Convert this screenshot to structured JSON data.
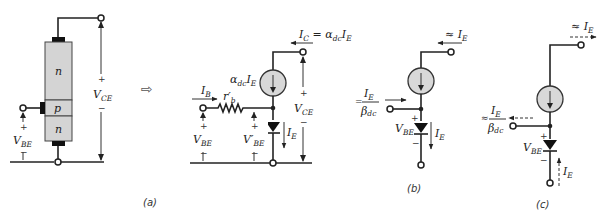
{
  "figure": {
    "panels": [
      {
        "id": "a",
        "caption": "(a)"
      },
      {
        "id": "b",
        "caption": "(b)"
      },
      {
        "id": "c",
        "caption": "(c)"
      }
    ],
    "transistor": {
      "regions": [
        "n",
        "p",
        "n"
      ],
      "vce_label": "V",
      "vce_sub": "CE",
      "vbe_label": "V",
      "vbe_sub": "BE",
      "plus": "+",
      "minus": "−"
    },
    "arrow_symbol": "⇨",
    "model_a": {
      "ic_label": "I",
      "ic_sub": "C",
      "ic_eq": " = α",
      "ic_eq_sub": "dc",
      "ic_rhs": "I",
      "ic_rhs_sub": "E",
      "source_label": "α",
      "source_sub": "dc",
      "source_i": "I",
      "source_i_sub": "E",
      "ib_label": "I",
      "ib_sub": "B",
      "rb_label": "r′",
      "rb_sub": "b",
      "vbe_label": "V",
      "vbe_sub": "BE",
      "vbe_prime_label": "V′",
      "vbe_prime_sub": "BE",
      "ie_label": "I",
      "ie_sub": "E",
      "vce_label": "V",
      "vce_sub": "CE",
      "plus": "+",
      "minus": "−"
    },
    "model_b": {
      "top_label": "≈ I",
      "top_sub": "E",
      "base_num": "I",
      "base_num_sub": "E",
      "base_den": "β",
      "base_den_sub": "dc",
      "base_prefix": "=",
      "vbe_label": "V",
      "vbe_sub": "BE",
      "ie_label": "I",
      "ie_sub": "E",
      "plus": "+",
      "minus": "−"
    },
    "model_c": {
      "top_label": "≈ I",
      "top_sub": "E",
      "base_num": "I",
      "base_num_sub": "E",
      "base_den": "β",
      "base_den_sub": "dc",
      "base_prefix": "≈",
      "vbe_label": "V",
      "vbe_sub": "BE",
      "ie_label": "I",
      "ie_sub": "E",
      "plus": "+",
      "minus": "−"
    }
  }
}
